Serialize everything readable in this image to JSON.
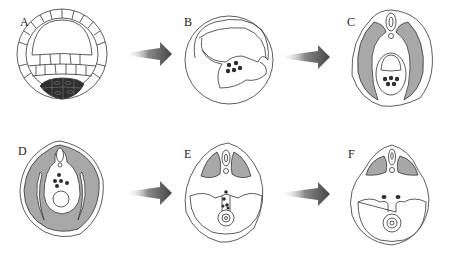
{
  "figure": {
    "panels": [
      {
        "id": "A",
        "label": "A",
        "content": "blastula with cell layers and dark cells at bottom"
      },
      {
        "id": "B",
        "label": "B",
        "content": "gastrulation with forming cavity and cell cluster"
      },
      {
        "id": "C",
        "label": "C",
        "content": "cross-section with neural tube, notochord, gray mesoderm and gut"
      },
      {
        "id": "D",
        "label": "D",
        "content": "cross-section with neural tube, gray mesoderm, gut and yolk"
      },
      {
        "id": "E",
        "label": "E",
        "content": "cross-section with somites, body cavity and gut"
      },
      {
        "id": "F",
        "label": "F",
        "content": "cross-section with somites, body cavity, paired structures and gut"
      }
    ],
    "arrows": [
      {
        "from": "A",
        "to": "B"
      },
      {
        "from": "B",
        "to": "C"
      },
      {
        "from": "D",
        "to": "E"
      },
      {
        "from": "E",
        "to": "F"
      }
    ],
    "colors": {
      "line": "#333333",
      "gray_fill": "#a8a8a8",
      "dark_cells": "#2e2e2e",
      "arrow": "#555555",
      "background": "#ffffff"
    }
  }
}
